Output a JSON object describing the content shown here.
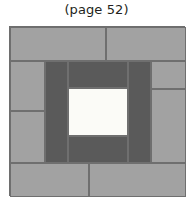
{
  "caption": "(page 52)",
  "figure": {
    "name": "quilt-block-diagram",
    "kind": "courthouse-steps quilt block",
    "colors": {
      "light_gray": "#a2a2a2",
      "dark_gray": "#5a5a5a",
      "center_white": "#fbfbf7",
      "outline": "#6f6f6f",
      "background": "#ffffff",
      "caption_text": "#231f20"
    },
    "patches": [
      {
        "id": "outer-top-left",
        "tone": "light",
        "x": 0,
        "y": 0,
        "w": 96,
        "h": 34
      },
      {
        "id": "outer-top-right",
        "tone": "light",
        "x": 96,
        "y": 0,
        "w": 80,
        "h": 34
      },
      {
        "id": "outer-left-upper",
        "tone": "light",
        "x": 0,
        "y": 34,
        "w": 35,
        "h": 50
      },
      {
        "id": "outer-left-lower",
        "tone": "light",
        "x": 0,
        "y": 84,
        "w": 35,
        "h": 52
      },
      {
        "id": "outer-right-upper",
        "tone": "light",
        "x": 141,
        "y": 34,
        "w": 35,
        "h": 28
      },
      {
        "id": "outer-right-lower",
        "tone": "light",
        "x": 141,
        "y": 62,
        "w": 35,
        "h": 74
      },
      {
        "id": "outer-bottom-left",
        "tone": "light",
        "x": 0,
        "y": 136,
        "w": 79,
        "h": 34
      },
      {
        "id": "outer-bottom-right",
        "tone": "light",
        "x": 79,
        "y": 136,
        "w": 97,
        "h": 34
      },
      {
        "id": "inner-left",
        "tone": "dark",
        "x": 35,
        "y": 34,
        "w": 23,
        "h": 102
      },
      {
        "id": "inner-right",
        "tone": "dark",
        "x": 118,
        "y": 34,
        "w": 23,
        "h": 102
      },
      {
        "id": "inner-top",
        "tone": "dark",
        "x": 58,
        "y": 34,
        "w": 60,
        "h": 27
      },
      {
        "id": "inner-bottom",
        "tone": "dark",
        "x": 58,
        "y": 109,
        "w": 60,
        "h": 27
      },
      {
        "id": "center-square",
        "tone": "center",
        "x": 58,
        "y": 61,
        "w": 60,
        "h": 48
      }
    ]
  }
}
